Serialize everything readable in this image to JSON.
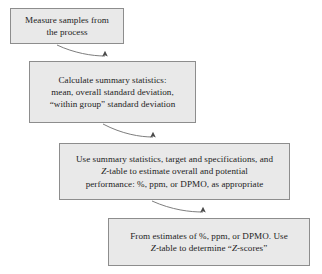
{
  "diagram": {
    "type": "flowchart",
    "orientation": "top-left to bottom-right cascade",
    "style": {
      "node_fill": "#e9e9e9",
      "node_border": "#8d8d8d",
      "text_color": "#1c1c1c",
      "connector_color": "#6e6e6e",
      "background": "#ffffff"
    },
    "nodes": [
      {
        "id": "measure",
        "label": "Measure samples from\nthe process",
        "lines": [
          "Measure samples from",
          "the process"
        ]
      },
      {
        "id": "calculate",
        "label": "Calculate summary statistics:\nmean, overall standard deviation,\n“within group” standard deviation",
        "lines": [
          "Calculate summary statistics:",
          "mean, overall standard deviation,",
          "“within group” standard deviation"
        ]
      },
      {
        "id": "estimate",
        "label": "Use summary statistics, target and specifications, and\nZ-table to estimate overall and potential\nperformance: %, ppm, or DPMO, as appropriate",
        "lines": [
          "Use summary statistics, target and specifications, and",
          "Z-table to estimate overall and potential",
          "performance: %, ppm, or DPMO, as appropriate"
        ]
      },
      {
        "id": "zscores",
        "label": "From estimates of %, ppm, or DPMO. Use\nZ-table to determine “Z-scores”",
        "lines": [
          "From estimates of %, ppm, or DPMO. Use",
          "Z-table to determine “Z-scores”"
        ]
      }
    ],
    "connectors": [
      {
        "id": "measure-to-calculate",
        "from": "measure",
        "to": "calculate",
        "arrow": "up-into-top-edge"
      },
      {
        "id": "calculate-to-estimate",
        "from": "calculate",
        "to": "estimate",
        "arrow": "up-into-top-edge"
      },
      {
        "id": "estimate-to-zscores",
        "from": "estimate",
        "to": "zscores",
        "arrow": "up-into-top-edge"
      }
    ]
  }
}
